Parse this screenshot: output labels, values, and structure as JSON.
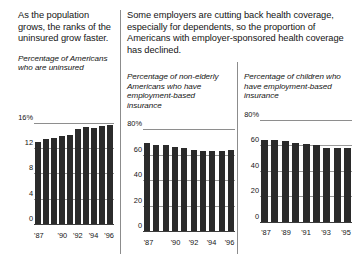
{
  "figure": {
    "background_color": "#ffffff",
    "bar_color": "#2b2b2b",
    "rule_color": "#8c8c8c"
  },
  "left_panel": {
    "headline": "As the population grows, the ranks of the uninsured grow faster.",
    "subtitle": "Percentage of Americans who are uninsured"
  },
  "right_panel": {
    "headline": "Some employers are cutting back health coverage, especially for dependents, so the proportion of Americans with employer-sponsored health coverage has declined.",
    "subtitle_chart2": "Percentage of non-elderly Americans who have employment-based insurance",
    "subtitle_chart3": "Percentage of children who have employment-based insurance"
  },
  "chart_data": [
    {
      "id": "uninsured-americans",
      "type": "bar",
      "title": "Percentage of Americans who are uninsured",
      "xlabel": "",
      "ylabel": "",
      "ylim": [
        0,
        17.5
      ],
      "grid": true,
      "legend": "none",
      "categories": [
        "'87",
        "'88",
        "'89",
        "'90",
        "'91",
        "'92",
        "'93",
        "'94",
        "'95",
        "'96"
      ],
      "values": [
        12.9,
        13.4,
        13.6,
        13.9,
        14.1,
        15.0,
        15.3,
        15.2,
        15.4,
        15.6
      ],
      "ytick_labels": [
        "16%",
        "12",
        "8",
        "4",
        "0"
      ],
      "ytick_values": [
        16,
        12,
        8,
        4,
        0
      ],
      "xtick_labels": [
        "'87",
        "'90",
        "'92",
        "'94",
        "'96"
      ],
      "xtick_indices": [
        0,
        3,
        5,
        7,
        9
      ]
    },
    {
      "id": "nonelderly-employment-based",
      "type": "bar",
      "title": "Percentage of non-elderly Americans who have employment-based insurance",
      "xlabel": "",
      "ylabel": "",
      "ylim": [
        0,
        87
      ],
      "grid": true,
      "legend": "none",
      "categories": [
        "'87",
        "'88",
        "'89",
        "'90",
        "'91",
        "'92",
        "'93",
        "'94",
        "'95",
        "'96"
      ],
      "values": [
        69,
        68,
        68,
        66,
        65,
        64,
        63,
        63,
        63,
        64
      ],
      "ytick_labels": [
        "80%",
        "60",
        "40",
        "20",
        "0"
      ],
      "ytick_values": [
        80,
        60,
        40,
        20,
        0
      ],
      "xtick_labels": [
        "'87",
        "'90",
        "'92",
        "'94",
        "'96"
      ],
      "xtick_indices": [
        0,
        3,
        5,
        7,
        9
      ]
    },
    {
      "id": "children-employment-based",
      "type": "bar",
      "title": "Percentage of children who have employment-based insurance",
      "xlabel": "",
      "ylabel": "",
      "ylim": [
        0,
        87
      ],
      "grid": true,
      "legend": "none",
      "categories": [
        "'87",
        "'88",
        "'89",
        "'90",
        "'91",
        "'92",
        "'93",
        "'94",
        "'95"
      ],
      "values": [
        64,
        64,
        63,
        62,
        61,
        60,
        58,
        58,
        58
      ],
      "ytick_labels": [
        "80%",
        "60",
        "40",
        "20",
        "0"
      ],
      "ytick_values": [
        80,
        60,
        40,
        20,
        0
      ],
      "xtick_labels": [
        "'87",
        "'89",
        "'91",
        "'93",
        "'95"
      ],
      "xtick_indices": [
        0,
        2,
        4,
        6,
        8
      ]
    }
  ]
}
